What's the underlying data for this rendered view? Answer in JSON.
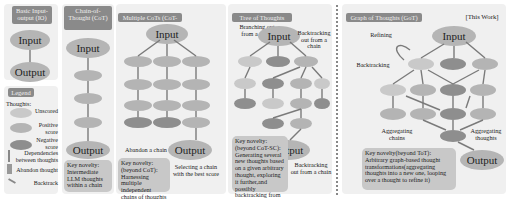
{
  "panels": {
    "io": {
      "title": "Basic Input-output (IO)",
      "input": "Input",
      "output": "Output"
    },
    "legend": {
      "title": "Legend",
      "thoughts_label": "Thoughts:",
      "items": [
        {
          "label": "Unscored",
          "icon": "unscored-thought-icon"
        },
        {
          "label": "Positive score",
          "icon": "positive-thought-icon"
        },
        {
          "label": "Negative score",
          "icon": "negative-thought-icon"
        },
        {
          "label": "Dependencies between thoughts",
          "icon": "dependency-arrow-icon"
        },
        {
          "label": "Abandon thought",
          "icon": "abandon-thought-icon"
        },
        {
          "label": "Backtrack",
          "icon": "backtrack-arrow-icon"
        }
      ]
    },
    "cot": {
      "title": "Chain-of-Thought (CoT)",
      "input": "Input",
      "output": "Output",
      "novelty": "Key novelty: Intermediate LLM thoughts within a chain"
    },
    "cotsc": {
      "title": "Multiple CoTs (CoT-SC)",
      "input": "Input",
      "output": "Output",
      "abandon": "Abandon a chain",
      "select": "Selecting a chain with the best score",
      "novelty": "Key novelty: (beyond CoT): Harnessing multiple independent chains of thoughts"
    },
    "tot": {
      "title": "Tree of Thoughts (ToT)",
      "input": "Input",
      "output": "Output",
      "branch": "Branching out from a chain",
      "backtrack_top": "Backtracking out from a chain",
      "backtrack_bottom": "Backtracking out from a chain",
      "novelty": "Key novelty: (beyond CoT-SC): Generating several new thoughts based on a given arbitrary thought, exploring it further,and possibly backtracking from it"
    },
    "got": {
      "title": "Graph of Thoughts (GoT)",
      "this_work": "[This Work]",
      "input": "Input",
      "output": "Output",
      "refining": "Refining",
      "backtracking": "Backtracking",
      "agg_chains": "Aggregating chains",
      "agg_thoughts": "Aggregating thoughts",
      "novelty": "Key novelty(beyond ToT): Arbitrary graph-based thought transformations(aggregating thoughts into a new one, looping over a thought to refine it)"
    }
  },
  "colors": {
    "panel_bg": "#f0f0f0",
    "title_bg": "#8a8a8a",
    "unscored": "#c9c9c9",
    "positive": "#b4b4b4",
    "negative": "#8e8e8e",
    "arrow": "#7a7a7a"
  }
}
